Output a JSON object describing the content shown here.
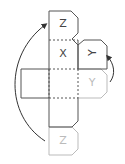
{
  "diagram": {
    "type": "cube-net-folding",
    "labels": {
      "top_face": "Z",
      "middle_face": "X",
      "right_tab": "Y",
      "right_ghost": "Y",
      "bottom_ghost": "Z"
    },
    "colors": {
      "line": "#555555",
      "ghost": "#bbbbbb",
      "arrow": "#333333"
    },
    "arrows": [
      {
        "name": "left-fold-arrow",
        "from": "bottom_ghost",
        "to": "top_face"
      },
      {
        "name": "right-fold-arrow",
        "from": "right_ghost",
        "to": "right_tab"
      }
    ]
  }
}
